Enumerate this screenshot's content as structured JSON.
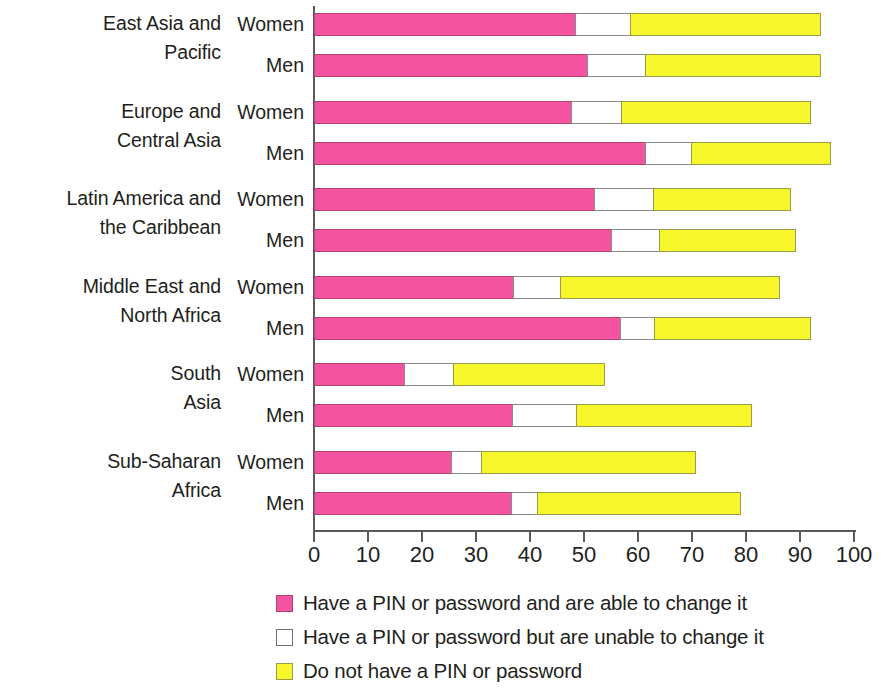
{
  "chart_data": {
    "type": "bar",
    "subtype": "horizontal-stacked",
    "title": "",
    "subtitle": "",
    "xlabel": "",
    "ylabel": "",
    "xlim": [
      0,
      100
    ],
    "xticks": [
      0,
      10,
      20,
      30,
      40,
      50,
      60,
      70,
      80,
      90,
      100
    ],
    "xtick_labels": [
      "0",
      "10",
      "20",
      "30",
      "40",
      "50",
      "60",
      "70",
      "80",
      "90",
      "100"
    ],
    "grid": false,
    "legend_position": "bottom-left",
    "colors": {
      "pin_changeable": "#f4539f",
      "pin_not_changeable": "#ffffff",
      "no_pin": "#f6f62b",
      "axis": "#5a5a5a",
      "text": "#231f20"
    },
    "series": [
      {
        "name": "Have a PIN or password and are able to change it",
        "key": "pin_changeable"
      },
      {
        "name": "Have a PIN or password but are unable to change it",
        "key": "pin_not_changeable"
      },
      {
        "name": "Do not have a PIN or password",
        "key": "no_pin"
      }
    ],
    "groups": [
      {
        "category": "East Asia and\nPacific",
        "rows": [
          {
            "label": "Women",
            "values": [
              48.5,
              10.4,
              35.4
            ],
            "cumulative": [
              48.5,
              58.9,
              94.3
            ]
          },
          {
            "label": "Men",
            "values": [
              50.7,
              11.0,
              32.6
            ],
            "cumulative": [
              50.7,
              61.7,
              94.3
            ]
          }
        ]
      },
      {
        "category": "Europe and\nCentral Asia",
        "rows": [
          {
            "label": "Women",
            "values": [
              47.8,
              9.4,
              35.2
            ],
            "cumulative": [
              47.8,
              57.2,
              92.4
            ]
          },
          {
            "label": "Men",
            "values": [
              61.5,
              8.7,
              25.9
            ],
            "cumulative": [
              61.5,
              70.2,
              96.1
            ]
          }
        ]
      },
      {
        "category": "Latin America and\nthe Caribbean",
        "rows": [
          {
            "label": "Women",
            "values": [
              52.0,
              11.1,
              25.6
            ],
            "cumulative": [
              52.0,
              63.1,
              88.7
            ]
          },
          {
            "label": "Men",
            "values": [
              55.2,
              9.1,
              25.3
            ],
            "cumulative": [
              55.2,
              64.3,
              89.6
            ]
          }
        ]
      },
      {
        "category": "Middle East and\nNorth Africa",
        "rows": [
          {
            "label": "Women",
            "values": [
              37.0,
              8.9,
              40.8
            ],
            "cumulative": [
              37.0,
              45.9,
              86.7
            ]
          },
          {
            "label": "Men",
            "values": [
              56.9,
              6.4,
              29.1
            ],
            "cumulative": [
              56.9,
              63.3,
              92.4
            ]
          }
        ]
      },
      {
        "category": "South\nAsia",
        "rows": [
          {
            "label": "Women",
            "values": [
              16.9,
              9.2,
              28.2
            ],
            "cumulative": [
              16.9,
              26.1,
              54.3
            ]
          },
          {
            "label": "Men",
            "values": [
              36.9,
              12.0,
              32.6
            ],
            "cumulative": [
              36.9,
              48.9,
              81.5
            ]
          }
        ]
      },
      {
        "category": "Sub-Saharan\nAfrica",
        "rows": [
          {
            "label": "Women",
            "values": [
              25.6,
              5.7,
              39.8
            ],
            "cumulative": [
              25.6,
              31.3,
              71.1
            ]
          },
          {
            "label": "Men",
            "values": [
              36.7,
              5.0,
              37.7
            ],
            "cumulative": [
              36.7,
              41.7,
              79.4
            ]
          }
        ]
      }
    ]
  },
  "legend": {
    "items": [
      {
        "label": "Have a PIN or password and are able to change it",
        "key": "pin-changeable"
      },
      {
        "label": "Have a PIN or password but are unable to change it",
        "key": "pin-fixed"
      },
      {
        "label": "Do not have a PIN or password",
        "key": "no-pin"
      }
    ]
  }
}
